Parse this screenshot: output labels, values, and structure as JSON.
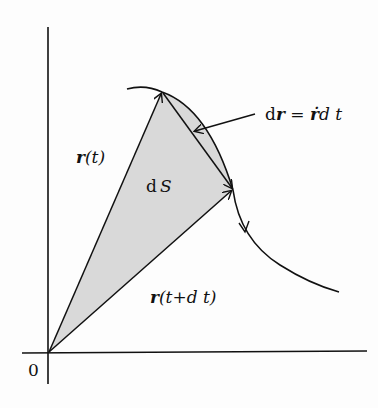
{
  "diagram": {
    "origin_label": "0",
    "labels": {
      "r_t": {
        "vec": "r",
        "rest": "(t)"
      },
      "r_t_dt": {
        "vec": "r",
        "rest": "(t+d t)"
      },
      "dS": {
        "d": "d",
        "var": "S"
      },
      "dr": {
        "d": "d",
        "vec": "r",
        "eq": " = ",
        "rdot": "ṙ",
        "dt": "d t"
      }
    },
    "colors": {
      "line": "#111111",
      "shade": "#d9d9d9",
      "background": "#fdfdfd"
    }
  }
}
